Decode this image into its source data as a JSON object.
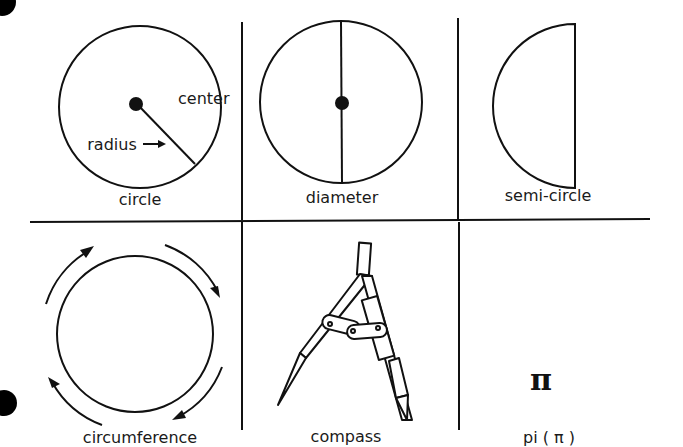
{
  "panels": [
    {
      "id": "circle",
      "label": "circle",
      "annotations": {
        "center": "center",
        "radius": "radius"
      }
    },
    {
      "id": "diameter",
      "label": "diameter"
    },
    {
      "id": "semi-circle",
      "label": "semi-circle"
    },
    {
      "id": "circumference",
      "label": "circumference"
    },
    {
      "id": "compass",
      "label": "compass"
    },
    {
      "id": "pi",
      "label": "pi ( π )",
      "symbol": "π"
    }
  ],
  "colors": {
    "ink": "#111111",
    "background": "#ffffff"
  }
}
